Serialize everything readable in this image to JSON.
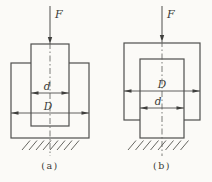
{
  "figure": {
    "background_color": "#fbfaf7",
    "line_color": "#4f4f4d",
    "text_color": "#3a3a36",
    "diagrams": [
      {
        "caption": "(a)",
        "force_label": "F",
        "top_dimension_label": "d",
        "bottom_dimension_label": "D"
      },
      {
        "caption": "(b)",
        "force_label": "F",
        "top_dimension_label": "D",
        "bottom_dimension_label": "d"
      }
    ]
  }
}
